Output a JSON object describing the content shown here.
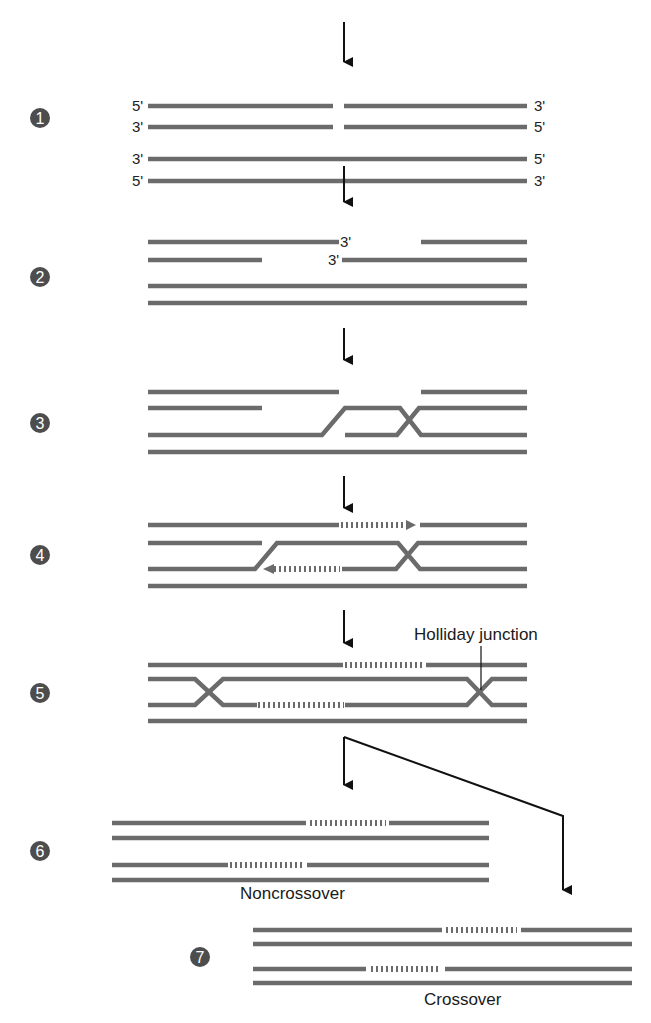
{
  "figure": {
    "colors": {
      "strand": "#6b6b6b",
      "arrow": "#111111",
      "step_circle": "#4d4d4d",
      "background": "#ffffff"
    },
    "steps": [
      {
        "number": "1",
        "end_labels_left": [
          "5'",
          "3'",
          "3'",
          "5'"
        ],
        "end_labels_right": [
          "3'",
          "5'",
          "5'",
          "3'"
        ]
      },
      {
        "number": "2",
        "end_labels_mid": [
          "3'",
          "3'"
        ]
      },
      {
        "number": "3"
      },
      {
        "number": "4"
      },
      {
        "number": "5",
        "annotation": "Holliday junction"
      },
      {
        "number": "6",
        "outcome": "Noncrossover"
      },
      {
        "number": "7",
        "outcome": "Crossover"
      }
    ]
  }
}
